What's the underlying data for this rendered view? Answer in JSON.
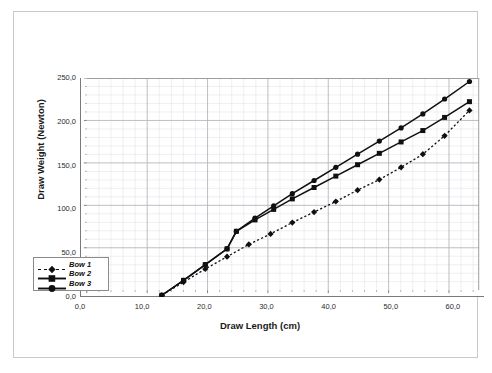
{
  "chart_data": {
    "type": "line",
    "title": "",
    "xlabel": "Draw Length (cm)",
    "ylabel": "Draw Weight (Newton)",
    "xlim": [
      0,
      65
    ],
    "ylim": [
      0,
      250
    ],
    "xticks": [
      "0,0",
      "10,0",
      "20,0",
      "30,0",
      "40,0",
      "50,0",
      "60,0"
    ],
    "xtick_values": [
      0,
      10,
      20,
      30,
      40,
      50,
      60
    ],
    "yticks": [
      "0,0",
      "50,0",
      "100,0",
      "150,0",
      "200,0",
      "250,0"
    ],
    "ytick_values": [
      0,
      50,
      100,
      150,
      200,
      250
    ],
    "grid": true,
    "minor_grid": true,
    "legend_position": "lower-left",
    "series": [
      {
        "name": "Bow 1",
        "marker": "diamond",
        "line": "dashed",
        "color": "#101010",
        "x": [
          13.0,
          16.5,
          20.0,
          23.5,
          27.0,
          30.5,
          34.0,
          37.5,
          41.0,
          44.5,
          48.0,
          51.5,
          55.0,
          58.5,
          62.5
        ],
        "y": [
          2.0,
          17.0,
          32.0,
          46.0,
          60.0,
          72.0,
          85.0,
          97.0,
          109.0,
          122.0,
          134.0,
          148.0,
          163.0,
          184.0,
          213.0
        ]
      },
      {
        "name": "Bow 2",
        "marker": "square",
        "line": "solid",
        "color": "#101010",
        "x": [
          13.0,
          16.5,
          20.0,
          23.5,
          25.0,
          28.0,
          31.0,
          34.0,
          37.5,
          41.0,
          44.5,
          48.0,
          51.5,
          55.0,
          58.5,
          62.5
        ],
        "y": [
          2.0,
          19.0,
          37.0,
          55.0,
          75.0,
          88.0,
          100.0,
          112.0,
          125.0,
          138.0,
          151.0,
          164.0,
          177.0,
          190.0,
          205.0,
          223.0
        ]
      },
      {
        "name": "Bow 3",
        "marker": "circle",
        "line": "solid",
        "color": "#101010",
        "x": [
          13.0,
          16.5,
          20.0,
          23.5,
          25.0,
          28.0,
          31.0,
          34.0,
          37.5,
          41.0,
          44.5,
          48.0,
          51.5,
          55.0,
          58.5,
          62.5
        ],
        "y": [
          2.0,
          19.0,
          37.0,
          55.0,
          75.0,
          90.0,
          104.0,
          118.0,
          133.0,
          148.0,
          163.0,
          178.0,
          193.0,
          209.0,
          226.0,
          246.0
        ]
      }
    ]
  },
  "legend": {
    "items": [
      {
        "label": "Bow 1"
      },
      {
        "label": "Bow 2"
      },
      {
        "label": "Bow 3"
      }
    ]
  }
}
